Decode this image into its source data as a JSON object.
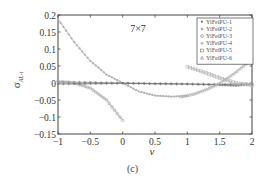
{
  "chart_data": {
    "type": "line",
    "title": "",
    "annotation": "7×7",
    "caption": "(c)",
    "xlabel": "ν",
    "ylabel": "σ",
    "ylabel_sub": "AL-i",
    "xlim": [
      -1,
      2
    ],
    "ylim": [
      -0.15,
      0.2
    ],
    "xticks": [
      -1,
      -0.5,
      0,
      0.5,
      1,
      1.5,
      2
    ],
    "xtick_labels": [
      "−1",
      "−0.5",
      "0",
      "0.5",
      "1",
      "1.5",
      "2"
    ],
    "yticks": [
      0.2,
      0.15,
      0.1,
      0.05,
      0,
      -0.05,
      -0.1,
      -0.15
    ],
    "ytick_labels": [
      "0.2",
      "0.15",
      "0.1",
      "0.05",
      "0",
      "−0.05",
      "−0.1",
      "−0.15"
    ],
    "grid": false,
    "legend_position": "upper right",
    "series": [
      {
        "name": "YiFeiPU-1",
        "marker": "dot",
        "color": "#b0b0b0",
        "x": [
          -1,
          -0.75,
          -0.5,
          -0.25,
          0,
          0.25,
          0.5,
          0.75,
          1
        ],
        "y": [
          0.188,
          0.12,
          0.065,
          0.025,
          0.0,
          -0.025,
          -0.037,
          -0.04,
          -0.038
        ]
      },
      {
        "name": "YiFeiPU-2",
        "marker": "asterisk",
        "color": "#888888",
        "x": [
          -1,
          -0.5,
          0,
          0.5,
          1,
          1.5,
          1.75,
          2
        ],
        "y": [
          0.003,
          0.002,
          0.0,
          -0.002,
          -0.003,
          -0.006,
          -0.008,
          -0.004
        ]
      },
      {
        "name": "YiFeiPU-3",
        "marker": "circle",
        "color": "#a8a8a8",
        "x": [
          -1,
          -0.75,
          -0.5,
          -0.25,
          0
        ],
        "y": [
          0.005,
          0.0,
          -0.015,
          -0.05,
          -0.11
        ]
      },
      {
        "name": "YiFeiPU-4",
        "marker": "plus",
        "color": "#707070",
        "x": [
          -1,
          -0.5,
          0,
          0.5,
          1,
          1.5,
          2
        ],
        "y": [
          -0.003,
          -0.002,
          -0.001,
          -0.002,
          -0.003,
          -0.004,
          -0.003
        ]
      },
      {
        "name": "YiFeiPU-5",
        "marker": "square",
        "color": "#b8b8b8",
        "x": [
          1,
          1.25,
          1.5,
          1.75,
          2
        ],
        "y": [
          0.048,
          0.032,
          0.015,
          0.0,
          -0.006
        ]
      },
      {
        "name": "YiFeiPU-6",
        "marker": "triangle",
        "color": "#b4b4b4",
        "x": [
          0.9,
          1.1,
          1.3,
          1.5,
          1.7,
          1.9,
          2
        ],
        "y": [
          -0.04,
          -0.032,
          -0.018,
          0.0,
          0.025,
          0.055,
          0.075
        ]
      }
    ]
  }
}
